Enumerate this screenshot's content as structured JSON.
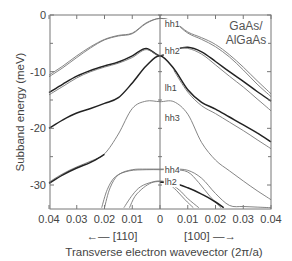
{
  "chart_data": {
    "type": "line",
    "title": "",
    "annotation": "GaAs/\nAlGaAs",
    "annotation_lines": [
      "GaAs/",
      "AlGaAs"
    ],
    "xlabel": "Transverse electron wavevector  (2π/a)",
    "ylabel": "Subband energy (meV)",
    "x_direction_left": "←— [110]",
    "x_direction_right": "[100] —→",
    "xlim_left": [
      0.04,
      0
    ],
    "xlim_right": [
      0,
      0.04
    ],
    "ylim": [
      -34,
      0
    ],
    "x_ticks": [
      "0.04",
      "0.03",
      "0.02",
      "0.01",
      "0",
      "0.01",
      "0.02",
      "0.03",
      "0.04"
    ],
    "y_ticks": [
      "0",
      "-10",
      "-20",
      "-30"
    ],
    "y_tick_values": [
      0,
      -10,
      -20,
      -30
    ],
    "grid": false,
    "note": "x is signed: negative = [110] direction (left), positive = [100] direction (right). Each band drawn as two close lines (spin-split).",
    "series": [
      {
        "name": "hh1",
        "style": "thin",
        "x": [
          -0.04,
          -0.035,
          -0.03,
          -0.025,
          -0.02,
          -0.015,
          -0.01,
          -0.005,
          0,
          0.005,
          0.01,
          0.015,
          0.02,
          0.025,
          0.03,
          0.035,
          0.04
        ],
        "y": [
          -10.6,
          -9.0,
          -7.2,
          -5.6,
          -4.3,
          -3.6,
          -3.2,
          -1.4,
          -0.6,
          -1.2,
          -3.0,
          -4.0,
          -5.2,
          -7.0,
          -9.2,
          -11.6,
          -13.9
        ]
      },
      {
        "name": "hh1b",
        "style": "thin",
        "x": [
          -0.04,
          -0.035,
          -0.03,
          -0.025,
          -0.02,
          -0.015,
          -0.01,
          -0.005,
          0,
          0.005,
          0.01,
          0.015,
          0.02,
          0.025,
          0.03,
          0.035,
          0.04
        ],
        "y": [
          -10.9,
          -9.3,
          -7.5,
          -5.8,
          -4.4,
          -3.7,
          -3.3,
          -1.5,
          -0.6,
          -1.3,
          -3.2,
          -4.3,
          -5.6,
          -7.4,
          -9.7,
          -12.2,
          -14.4
        ]
      },
      {
        "name": "hh2",
        "style": "thick",
        "x": [
          -0.04,
          -0.035,
          -0.03,
          -0.025,
          -0.02,
          -0.015,
          -0.01,
          -0.005,
          0,
          0.005,
          0.01,
          0.015,
          0.02,
          0.025,
          0.03,
          0.035,
          0.04
        ],
        "y": [
          -13.7,
          -12.2,
          -10.8,
          -9.8,
          -9.0,
          -8.3,
          -7.2,
          -5.9,
          -7.2,
          -6.2,
          -5.7,
          -6.5,
          -8.2,
          -10.0,
          -11.7,
          -13.5,
          -15.2
        ]
      },
      {
        "name": "hh2b",
        "style": "thin",
        "x": [
          -0.04,
          -0.035,
          -0.03,
          -0.025,
          -0.02,
          -0.015,
          -0.01,
          -0.005,
          0,
          0.005,
          0.01,
          0.015,
          0.02,
          0.025,
          0.03,
          0.035,
          0.04
        ],
        "y": [
          -14.1,
          -12.6,
          -11.1,
          -10.0,
          -9.2,
          -8.5,
          -7.5,
          -6.1,
          -7.2,
          -6.0,
          -5.9,
          -6.9,
          -8.8,
          -10.8,
          -12.7,
          -14.8,
          -16.9
        ]
      },
      {
        "name": "lh1",
        "style": "thick",
        "x": [
          -0.04,
          -0.035,
          -0.03,
          -0.025,
          -0.02,
          -0.015,
          -0.01,
          -0.005,
          0,
          0.005,
          0.01,
          0.015,
          0.02,
          0.025,
          0.03,
          0.035,
          0.04
        ],
        "y": [
          -20.0,
          -18.5,
          -17.3,
          -16.5,
          -15.6,
          -14.6,
          -12.0,
          -9.0,
          -7.2,
          -9.5,
          -13.2,
          -15.4,
          -16.6,
          -18.0,
          -19.4,
          -20.8,
          -22.4
        ]
      },
      {
        "name": "lh1b",
        "style": "thin",
        "x": [
          0.005,
          0.01,
          0.015,
          0.02,
          0.025,
          0.03,
          0.035,
          0.04
        ],
        "y": [
          -9.8,
          -13.6,
          -16.0,
          -17.4,
          -18.9,
          -20.4,
          -22.0,
          -23.6
        ]
      },
      {
        "name": "hh3",
        "style": "thin",
        "x": [
          -0.04,
          -0.035,
          -0.03,
          -0.025,
          -0.02,
          -0.015,
          -0.01,
          -0.005,
          0,
          0.005,
          0.01,
          0.015,
          0.02,
          0.025,
          0.03,
          0.035,
          0.04
        ],
        "y": [
          -29.5,
          -28.0,
          -26.8,
          -25.8,
          -24.5,
          -21.0,
          -16.5,
          -15.2,
          -15.3,
          -15.3,
          -17.5,
          -22.5,
          -25.6,
          -27.5,
          -29.3,
          -31.0,
          -32.6
        ]
      },
      {
        "name": "hh3b",
        "style": "thick",
        "x": [
          -0.04,
          -0.035,
          -0.03,
          -0.025,
          -0.02
        ],
        "y": [
          -29.7,
          -28.2,
          -27.0,
          -26.0,
          -24.6
        ]
      },
      {
        "name": "hh4",
        "style": "thin",
        "x": [
          -0.02,
          -0.018,
          -0.015,
          -0.01,
          -0.005,
          0,
          0.005,
          0.01,
          0.015,
          0.02,
          0.025,
          0.03,
          0.035,
          0.04
        ],
        "y": [
          -34.0,
          -30.5,
          -28.2,
          -27.3,
          -27.2,
          -27.2,
          -27.2,
          -27.4,
          -28.8,
          -31.5,
          -33.6,
          -33.8,
          -33.9,
          -34.0
        ]
      },
      {
        "name": "hh4b",
        "style": "thin",
        "x": [
          -0.021,
          -0.019,
          -0.016,
          -0.011,
          -0.005,
          0,
          0.005,
          0.01,
          0.014,
          0.018,
          0.022
        ],
        "y": [
          -34.0,
          -30.8,
          -28.5,
          -27.5,
          -27.3,
          -27.3,
          -27.3,
          -27.7,
          -29.6,
          -32.0,
          -34.0
        ]
      },
      {
        "name": "lh2",
        "style": "thin",
        "x": [
          -0.011,
          -0.009,
          -0.006,
          -0.003,
          0,
          0.003,
          0.006,
          0.009,
          0.012
        ],
        "y": [
          -34.0,
          -32.0,
          -30.5,
          -29.6,
          -29.4,
          -29.8,
          -31.0,
          -32.6,
          -34.0
        ]
      },
      {
        "name": "lh2b",
        "style": "thin",
        "x": [
          -0.013,
          -0.01,
          -0.007,
          -0.003,
          0,
          0.003,
          0.007,
          0.01,
          0.014
        ],
        "y": [
          -34.0,
          -31.8,
          -30.3,
          -29.5,
          -29.3,
          -29.6,
          -30.9,
          -32.4,
          -34.0
        ]
      },
      {
        "name": "lh2c",
        "style": "thick",
        "x": [
          0,
          0.005,
          0.01,
          0.015,
          0.02,
          0.023
        ],
        "y": [
          -29.5,
          -29.7,
          -30.5,
          -31.6,
          -33.0,
          -34.0
        ]
      }
    ],
    "band_labels": [
      {
        "text": "hh1",
        "x": 0.001,
        "y": -0.9
      },
      {
        "text": "hh2",
        "x": 0.001,
        "y": -5.7
      },
      {
        "text": "lh1",
        "x": 0.001,
        "y": -12.2
      },
      {
        "text": "hh3",
        "x": 0.001,
        "y": -17.4
      },
      {
        "text": "hh4",
        "x": 0.001,
        "y": -26.6
      },
      {
        "text": "lh2",
        "x": 0.001,
        "y": -28.8
      }
    ]
  },
  "colors": {
    "axis": "#666666",
    "curve": "#333333",
    "text": "#444444"
  }
}
